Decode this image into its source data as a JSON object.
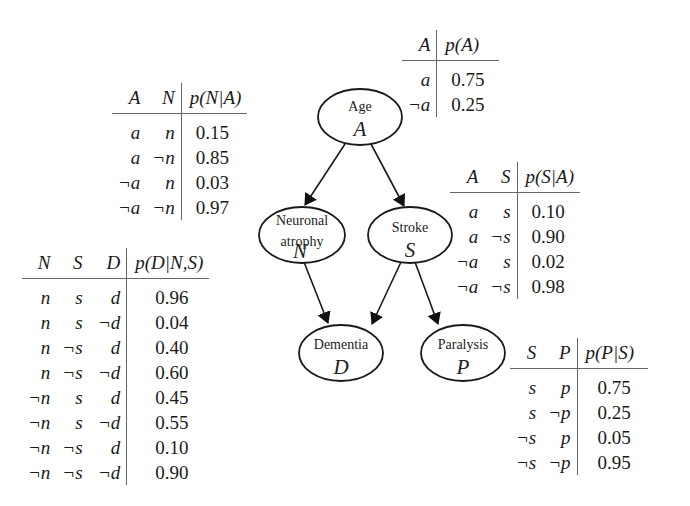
{
  "nodes": [
    {
      "id": "A",
      "label": "Age",
      "symbol": "A"
    },
    {
      "id": "N",
      "label_line1": "Neuronal",
      "label_line2": "atrophy",
      "symbol": "N"
    },
    {
      "id": "S",
      "label": "Stroke",
      "symbol": "S"
    },
    {
      "id": "D",
      "label": "Dementia",
      "symbol": "D"
    },
    {
      "id": "P",
      "label": "Paralysis",
      "symbol": "P"
    }
  ],
  "edges": [
    {
      "from": "A",
      "to": "N"
    },
    {
      "from": "A",
      "to": "S"
    },
    {
      "from": "N",
      "to": "D"
    },
    {
      "from": "S",
      "to": "D"
    },
    {
      "from": "S",
      "to": "P"
    }
  ],
  "tables": {
    "pA": {
      "headers": [
        "A",
        "p(A)"
      ],
      "rows": [
        {
          "a": "a",
          "p": "0.75"
        },
        {
          "a": "¬a",
          "p": "0.25"
        }
      ]
    },
    "pNA": {
      "headers": [
        "A",
        "N",
        "p(N|A)"
      ],
      "rows": [
        {
          "a": "a",
          "n": "n",
          "p": "0.15"
        },
        {
          "a": "a",
          "n": "¬n",
          "p": "0.85"
        },
        {
          "a": "¬a",
          "n": "n",
          "p": "0.03"
        },
        {
          "a": "¬a",
          "n": "¬n",
          "p": "0.97"
        }
      ]
    },
    "pSA": {
      "headers": [
        "A",
        "S",
        "p(S|A)"
      ],
      "rows": [
        {
          "a": "a",
          "s": "s",
          "p": "0.10"
        },
        {
          "a": "a",
          "s": "¬s",
          "p": "0.90"
        },
        {
          "a": "¬a",
          "s": "s",
          "p": "0.02"
        },
        {
          "a": "¬a",
          "s": "¬s",
          "p": "0.98"
        }
      ]
    },
    "pDNS": {
      "headers": [
        "N",
        "S",
        "D",
        "p(D|N,S)"
      ],
      "rows": [
        {
          "n": "n",
          "s": "s",
          "d": "d",
          "p": "0.96"
        },
        {
          "n": "n",
          "s": "s",
          "d": "¬d",
          "p": "0.04"
        },
        {
          "n": "n",
          "s": "¬s",
          "d": "d",
          "p": "0.40"
        },
        {
          "n": "n",
          "s": "¬s",
          "d": "¬d",
          "p": "0.60"
        },
        {
          "n": "¬n",
          "s": "s",
          "d": "d",
          "p": "0.45"
        },
        {
          "n": "¬n",
          "s": "s",
          "d": "¬d",
          "p": "0.55"
        },
        {
          "n": "¬n",
          "s": "¬s",
          "d": "d",
          "p": "0.10"
        },
        {
          "n": "¬n",
          "s": "¬s",
          "d": "¬d",
          "p": "0.90"
        }
      ]
    },
    "pPS": {
      "headers": [
        "S",
        "P",
        "p(P|S)"
      ],
      "rows": [
        {
          "s": "s",
          "p_val": "p",
          "p": "0.75"
        },
        {
          "s": "s",
          "p_val": "¬p",
          "p": "0.25"
        },
        {
          "s": "¬s",
          "p_val": "p",
          "p": "0.05"
        },
        {
          "s": "¬s",
          "p_val": "¬p",
          "p": "0.95"
        }
      ]
    }
  },
  "colors": {
    "stroke": "#1a1a1a",
    "rule": "#666666",
    "background": "#ffffff"
  }
}
